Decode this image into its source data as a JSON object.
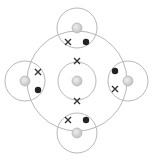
{
  "diagram": {
    "type": "dot-and-cross bonding diagram",
    "colors": {
      "shell": "#b8b8b8",
      "nucleus": "#c4c4c4",
      "dot": "#222222",
      "cross": "#333333"
    },
    "central_atom": {
      "cx": 77,
      "cy": 81,
      "inner_shell_r": 19,
      "outer_shell_r": 50,
      "inner_electrons": "cross"
    },
    "outer_atoms": [
      {
        "name": "top",
        "cx": 77,
        "cy": 28,
        "r": 20
      },
      {
        "name": "left",
        "cx": 25,
        "cy": 81,
        "r": 20
      },
      {
        "name": "right",
        "cx": 128,
        "cy": 81,
        "r": 20
      },
      {
        "name": "bottom",
        "cx": 77,
        "cy": 133,
        "r": 20
      }
    ],
    "bonding_pairs": [
      {
        "cross": [
          68,
          42
        ],
        "dot": [
          86,
          42
        ]
      },
      {
        "cross": [
          38,
          72
        ],
        "dot": [
          38,
          90
        ]
      },
      {
        "cross": [
          115,
          89
        ],
        "dot": [
          115,
          71
        ]
      },
      {
        "cross": [
          68,
          120
        ],
        "dot": [
          86,
          120
        ]
      }
    ],
    "inner_crosses": [
      [
        77,
        61
      ],
      [
        77,
        101
      ]
    ]
  }
}
